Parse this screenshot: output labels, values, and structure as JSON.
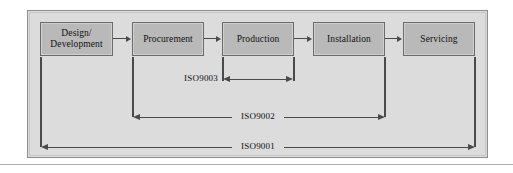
{
  "figure": {
    "background_color": "#dcdcdc",
    "box_fill_color": "#b9b9b9",
    "line_color": "#4a4a4a"
  },
  "process": {
    "steps": [
      {
        "id": "design-development",
        "line1": "Design/",
        "line2": "Development"
      },
      {
        "id": "procurement",
        "line1": "Procurement",
        "line2": ""
      },
      {
        "id": "production",
        "line1": "Production",
        "line2": ""
      },
      {
        "id": "installation",
        "line1": "Installation",
        "line2": ""
      },
      {
        "id": "servicing",
        "line1": "Servicing",
        "line2": ""
      }
    ]
  },
  "scopes": [
    {
      "id": "iso9003",
      "label": "ISO9003",
      "covers": "Production"
    },
    {
      "id": "iso9002",
      "label": "ISO9002",
      "covers": "Procurement to Installation"
    },
    {
      "id": "iso9001",
      "label": "ISO9001",
      "covers": "Design/Development to Servicing"
    }
  ]
}
